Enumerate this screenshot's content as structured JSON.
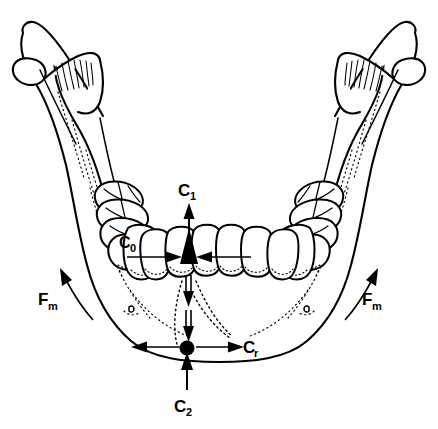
{
  "figure": {
    "background_color": "#ffffff",
    "line_color": "#000000"
  },
  "labels": {
    "c1": {
      "base": "C",
      "sub": "1",
      "full": "C₁",
      "meaning": "bite force at incisors, directed superiorly"
    },
    "c2": {
      "base": "C",
      "sub": "2",
      "full": "C₂",
      "meaning": "reaction force at mandibular symphysis, directed superiorly"
    },
    "c0": {
      "base": "C",
      "sub": "0",
      "full": "C₀",
      "meaning": "force at canine / premolar region"
    },
    "cr": {
      "base": "C",
      "sub": "r",
      "full": "Cᵣ",
      "meaning": "resultant transverse force at symphysis"
    },
    "fm_left": {
      "base": "F",
      "sub": "m",
      "full": "Fₘ",
      "meaning": "muscle force, left side"
    },
    "fm_right": {
      "base": "F",
      "sub": "m",
      "full": "Fₘ",
      "meaning": "muscle force, right side"
    }
  },
  "force_vectors": [
    {
      "name": "c1-arrow",
      "direction": "up",
      "label": "C₁",
      "location": "central incisors"
    },
    {
      "name": "c2-arrow",
      "direction": "up",
      "label": "C₂",
      "location": "below symphysis"
    },
    {
      "name": "transverse-arrow-left",
      "direction": "left-inward",
      "label": "",
      "location": "incisal region"
    },
    {
      "name": "transverse-arrow-right",
      "direction": "right-inward",
      "label": "",
      "location": "incisal region"
    },
    {
      "name": "symphysis-arrow-left",
      "direction": "left-outward",
      "label": "",
      "location": "symphysis"
    },
    {
      "name": "symphysis-arrow-right",
      "direction": "right-outward",
      "label": "Cᵣ",
      "location": "symphysis"
    },
    {
      "name": "vertical-arrow-upper",
      "direction": "down",
      "label": "",
      "location": "midline below teeth"
    },
    {
      "name": "vertical-arrow-lower",
      "direction": "down",
      "label": "",
      "location": "midline above symphysis"
    },
    {
      "name": "fm-curve-left",
      "direction": "up-curved",
      "label": "Fₘ",
      "location": "left ramus"
    },
    {
      "name": "fm-curve-right",
      "direction": "up-curved",
      "label": "Fₘ",
      "location": "right ramus"
    }
  ],
  "anatomy": {
    "parts": [
      "left-condyle",
      "left-coronoid-process",
      "left-ramus",
      "left-body",
      "right-condyle",
      "right-coronoid-process",
      "right-ramus",
      "right-body",
      "mandibular-symphysis",
      "mental-foramen-left",
      "mental-foramen-right",
      "dental-arch"
    ],
    "teeth_count": 12
  }
}
